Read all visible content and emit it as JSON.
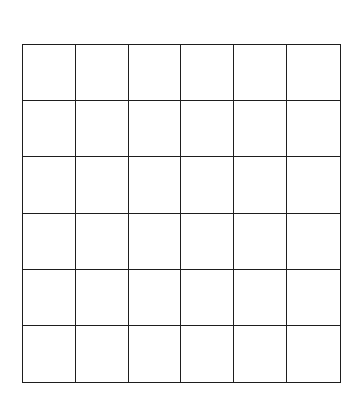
{
  "grid": {
    "rows": 6,
    "columns": 6,
    "line_color": "#1e1e1e",
    "background": "#ffffff",
    "cells": [
      [
        "",
        "",
        "",
        "",
        "",
        ""
      ],
      [
        "",
        "",
        "",
        "",
        "",
        ""
      ],
      [
        "",
        "",
        "",
        "",
        "",
        ""
      ],
      [
        "",
        "",
        "",
        "",
        "",
        ""
      ],
      [
        "",
        "",
        "",
        "",
        "",
        ""
      ],
      [
        "",
        "",
        "",
        "",
        "",
        ""
      ]
    ]
  }
}
